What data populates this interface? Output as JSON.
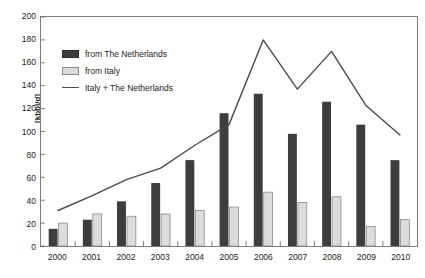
{
  "chart_data": {
    "type": "bar",
    "title": "",
    "subtitle": "",
    "xlabel": "",
    "ylabel": "[kbbl/d]",
    "categories": [
      "2000",
      "2001",
      "2002",
      "2003",
      "2004",
      "2005",
      "2006",
      "2007",
      "2008",
      "2009",
      "2010"
    ],
    "ylim": [
      0,
      200
    ],
    "ytick_step": 20,
    "yticks": [
      0,
      20,
      40,
      60,
      80,
      100,
      120,
      140,
      160,
      180,
      200
    ],
    "grid": false,
    "legend_position": "upper-left-inside",
    "series": [
      {
        "name": "from The Netherlands",
        "kind": "bar",
        "color": "#3d3d3d",
        "values": [
          15,
          23,
          39,
          55,
          75,
          116,
          133,
          98,
          126,
          106,
          75
        ]
      },
      {
        "name": "from Italy",
        "kind": "bar",
        "color": "#dcdcdc",
        "values": [
          20,
          28,
          26,
          28,
          31,
          34,
          47,
          38,
          43,
          17,
          23
        ]
      },
      {
        "name": "Italy + The Netherlands",
        "kind": "line",
        "color": "#4a4a4a",
        "values": [
          31,
          44,
          58,
          68,
          88,
          106,
          180,
          137,
          170,
          123,
          97
        ]
      }
    ]
  },
  "legend": {
    "items": [
      {
        "label": "from The Netherlands",
        "swatch": "bar-nl"
      },
      {
        "label": "from Italy",
        "swatch": "bar-it"
      },
      {
        "label": "Italy + The Netherlands",
        "swatch": "line-sum"
      }
    ]
  },
  "colors": {
    "netherlands_bar": "#3d3d3d",
    "italy_bar": "#dcdcdc",
    "italy_bar_border": "#8a8a8a",
    "sum_line": "#4a4a4a",
    "axis": "#7d7d7d",
    "text": "#1a1a1a",
    "background": "#ffffff"
  }
}
